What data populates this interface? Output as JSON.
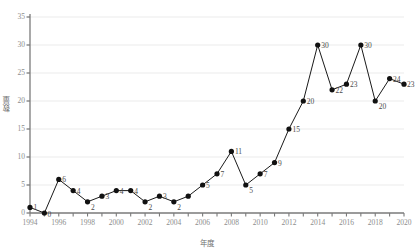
{
  "chart_data": {
    "type": "line",
    "title": "",
    "xlabel": "年度",
    "ylabel": "数量",
    "x": [
      1994,
      1995,
      1996,
      1997,
      1998,
      1999,
      2000,
      2001,
      2002,
      2003,
      2004,
      2005,
      2006,
      2007,
      2008,
      2009,
      2010,
      2011,
      2012,
      2013,
      2014,
      2015,
      2016,
      2017,
      2018,
      2019,
      2020
    ],
    "values": [
      1,
      0,
      6,
      4,
      2,
      3,
      4,
      4,
      2,
      3,
      2,
      3,
      5,
      7,
      11,
      5,
      7,
      9,
      15,
      20,
      30,
      22,
      23,
      30,
      20,
      24,
      23
    ],
    "point_labels": [
      "1",
      "0",
      "6",
      "4",
      "2",
      "3",
      "4",
      "4",
      "2",
      "3",
      "2",
      "",
      "5",
      "7",
      "11",
      "5",
      "7",
      "9",
      "15",
      "20",
      "30",
      "22",
      "23",
      "30",
      "20",
      "24",
      "23"
    ],
    "xlim": [
      1994,
      2020
    ],
    "ylim": [
      0,
      35
    ],
    "yticks": [
      0,
      5,
      10,
      15,
      20,
      25,
      30,
      35
    ],
    "ytick_labels": [
      "0",
      "5",
      "10",
      "15",
      "20",
      "25",
      "30",
      "35"
    ],
    "xticks": [
      1994,
      1996,
      1998,
      2000,
      2002,
      2004,
      2006,
      2008,
      2010,
      2012,
      2014,
      2016,
      2018,
      2020
    ],
    "xtick_labels": [
      "1994",
      "1996",
      "1998",
      "2000",
      "2002",
      "2004",
      "2006",
      "2008",
      "2010",
      "2012",
      "2014",
      "2016",
      "2018",
      "2020"
    ],
    "grid": "horizontal",
    "legend": null,
    "marker": "filled-circle",
    "line_color": "#1a1a1a",
    "marker_color": "#111111",
    "grid_color": "#ebebeb",
    "axis_color": "#7a7a7a",
    "tick_text_color": "#8d8d8d",
    "label_text_color": "#4a4a4a"
  }
}
